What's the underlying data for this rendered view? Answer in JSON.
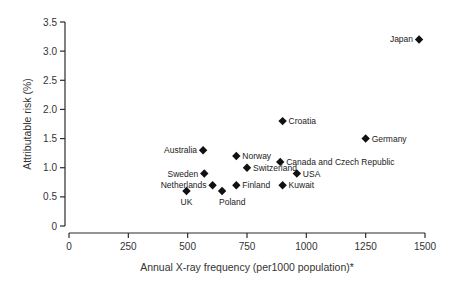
{
  "chart_data": {
    "type": "scatter",
    "title": "",
    "xlabel": "Annual X-ray frequency (per1000 population)*",
    "ylabel": "Attributable risk (%)",
    "xlim": [
      0,
      1500
    ],
    "ylim": [
      0,
      3.5
    ],
    "xticks": [
      "0",
      "250",
      "500",
      "750",
      "1000",
      "1250",
      "1500"
    ],
    "yticks": [
      "0",
      "0.5",
      "1.0",
      "1.5",
      "2.0",
      "2.5",
      "3.0",
      "3.5"
    ],
    "grid": false,
    "legend": null,
    "marker": "diamond",
    "points": [
      {
        "label": "Japan",
        "x": 1475,
        "y": 3.2,
        "label_pos": "left"
      },
      {
        "label": "Croatia",
        "x": 900,
        "y": 1.8,
        "label_pos": "right"
      },
      {
        "label": "Germany",
        "x": 1250,
        "y": 1.5,
        "label_pos": "right"
      },
      {
        "label": "Australia",
        "x": 565,
        "y": 1.3,
        "label_pos": "left"
      },
      {
        "label": "Norway",
        "x": 705,
        "y": 1.2,
        "label_pos": "right"
      },
      {
        "label": "Canada and Czech Republic",
        "x": 890,
        "y": 1.1,
        "label_pos": "right"
      },
      {
        "label": "Switzerland",
        "x": 750,
        "y": 1.0,
        "label_pos": "right"
      },
      {
        "label": "USA",
        "x": 960,
        "y": 0.9,
        "label_pos": "right"
      },
      {
        "label": "Sweden",
        "x": 570,
        "y": 0.9,
        "label_pos": "left"
      },
      {
        "label": "Netherlands",
        "x": 605,
        "y": 0.7,
        "label_pos": "left"
      },
      {
        "label": "Finland",
        "x": 705,
        "y": 0.7,
        "label_pos": "right"
      },
      {
        "label": "Kuwait",
        "x": 900,
        "y": 0.7,
        "label_pos": "right"
      },
      {
        "label": "UK",
        "x": 495,
        "y": 0.6,
        "label_pos": "below"
      },
      {
        "label": "Poland",
        "x": 645,
        "y": 0.6,
        "label_pos": "below-right"
      }
    ]
  }
}
